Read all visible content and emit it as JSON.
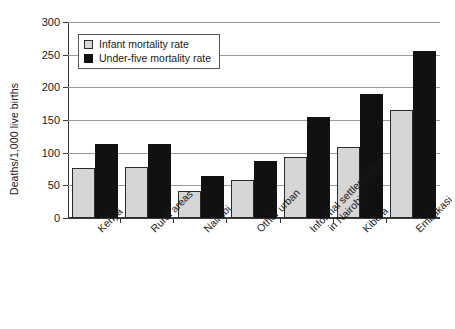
{
  "chart_data": {
    "type": "bar",
    "title": "",
    "xlabel": "",
    "ylabel": "Deaths/1,000 live births",
    "ylim": [
      0,
      300
    ],
    "ytick_step": 50,
    "yticks": [
      0,
      50,
      100,
      150,
      200,
      250,
      300
    ],
    "grid": true,
    "legend_position": "top-left",
    "categories": [
      "Kenya",
      "Rural areas",
      "Nairobi",
      "Other urban",
      "Informal settlements in Nairobi",
      "Kibera",
      "Embakasi"
    ],
    "category_lines": [
      [
        "Kenya"
      ],
      [
        "Rural areas"
      ],
      [
        "Nairobi"
      ],
      [
        "Other urban"
      ],
      [
        "Informal settlements",
        "in Nairobi"
      ],
      [
        "Kibera"
      ],
      [
        "Embakasi"
      ]
    ],
    "series": [
      {
        "name": "Infant mortality rate",
        "color": "#d6d6d6",
        "values": [
          76,
          78,
          41,
          58,
          93,
          108,
          165
        ]
      },
      {
        "name": "Under-five mortality rate",
        "color": "#111111",
        "values": [
          113,
          113,
          65,
          88,
          154,
          190,
          256
        ]
      }
    ]
  },
  "legend": {
    "items": [
      {
        "label": "Infant mortality rate",
        "swatch": "light"
      },
      {
        "label": "Under-five mortality rate",
        "swatch": "dark"
      }
    ]
  }
}
